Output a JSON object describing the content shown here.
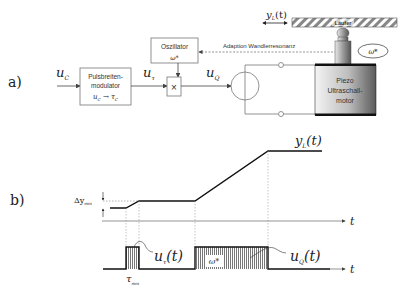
{
  "part_a": {
    "label": "a)",
    "input": {
      "symbol": "u",
      "subscript": "C"
    },
    "pwm_block": {
      "line1": "Pulsbreiten-",
      "line2": "modulator",
      "mapping_from": "u",
      "mapping_from_sub": "C",
      "arrow": "→",
      "mapping_to": "τ",
      "mapping_to_sub": "C"
    },
    "pwm_output": {
      "symbol": "u",
      "subscript": "τ"
    },
    "oscillator_block": {
      "title": "Oszillator",
      "output": "ω*"
    },
    "multiplier": {
      "symbol": "×"
    },
    "mult_output": {
      "symbol": "u",
      "subscript": "Q"
    },
    "feedback_label": "Adaption Wandlerresonanz",
    "motor": {
      "line1": "Piezo",
      "line2": "Ultraschall-",
      "line3": "motor"
    },
    "rotor_label": "ω*",
    "slider_label": "Läufer",
    "displacement": {
      "symbol": "y",
      "subscript": "L",
      "suffix": "(t)"
    }
  },
  "part_b": {
    "label": "b)",
    "position_curve": {
      "symbol": "y",
      "subscript": "L",
      "suffix": "(t)"
    },
    "delta_label": {
      "symbol": "Δy",
      "subscript": "min"
    },
    "time_axis_label": "t",
    "pulse_short": {
      "symbol": "u",
      "subscript": "τ",
      "suffix": "(t)"
    },
    "pulse_long": {
      "symbol": "u",
      "subscript": "Q",
      "suffix": "(t)"
    },
    "tau_min": {
      "symbol": "τ",
      "subscript": "min"
    },
    "carrier_label": "ω*"
  }
}
